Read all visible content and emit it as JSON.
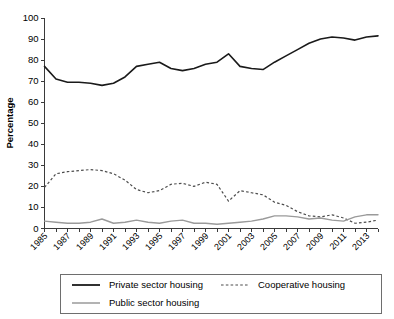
{
  "chart_data": {
    "type": "line",
    "title": "",
    "xlabel": "",
    "ylabel": "Percentage",
    "ylim": [
      0,
      100
    ],
    "ytick_step": 10,
    "ytick_labels": [
      "0",
      "10",
      "20",
      "30",
      "40",
      "50",
      "60",
      "70",
      "80",
      "90",
      "100"
    ],
    "grid": false,
    "legend_position": "bottom",
    "x": [
      1985,
      1986,
      1987,
      1988,
      1989,
      1990,
      1991,
      1992,
      1993,
      1994,
      1995,
      1996,
      1997,
      1998,
      1999,
      2000,
      2001,
      2002,
      2003,
      2004,
      2005,
      2006,
      2007,
      2008,
      2009,
      2010,
      2011,
      2012,
      2013,
      2014
    ],
    "xtick_labels": [
      "1985",
      "1987",
      "1989",
      "1991",
      "1993",
      "1995",
      "1997",
      "1999",
      "2001",
      "2003",
      "2005",
      "2007",
      "2009",
      "2011",
      "2013"
    ],
    "xtick_label_rotation": 45,
    "series": [
      {
        "name": "Private sector housing",
        "style": "solid",
        "color": "#1a1a1a",
        "values": [
          77,
          71,
          69.5,
          69.5,
          69,
          68,
          69,
          72,
          77,
          78,
          79,
          76,
          75,
          76,
          78,
          79,
          83,
          77,
          76,
          75.5,
          79,
          82,
          85,
          88,
          90,
          91,
          90.5,
          89.5,
          91,
          91.5
        ]
      },
      {
        "name": "Cooperative housing",
        "style": "dashed",
        "color": "#4d4d4d",
        "values": [
          19.5,
          26,
          27,
          27.5,
          28,
          27.5,
          26,
          23,
          18.5,
          17,
          18,
          21,
          21.5,
          20,
          22,
          21,
          13,
          18,
          17,
          16,
          12.5,
          11,
          8,
          6,
          5.5,
          6.5,
          5,
          2.5,
          3,
          4
        ]
      },
      {
        "name": "Public sector housing",
        "style": "solid",
        "color": "#9a9a9a",
        "values": [
          3.5,
          3,
          2.5,
          2.5,
          3,
          4.5,
          2.5,
          3,
          4,
          3,
          2.5,
          3.5,
          4,
          2.5,
          2.5,
          2,
          2.5,
          3,
          3.5,
          4.5,
          6,
          6,
          5.5,
          4.5,
          5,
          4,
          3.5,
          5.5,
          6.5,
          6.5
        ]
      }
    ]
  },
  "legend": {
    "entries": [
      {
        "label": "Private sector housing",
        "style": "solid-black"
      },
      {
        "label": "Cooperative housing",
        "style": "dashed-gray"
      },
      {
        "label": "Public sector housing",
        "style": "solid-gray"
      }
    ]
  }
}
